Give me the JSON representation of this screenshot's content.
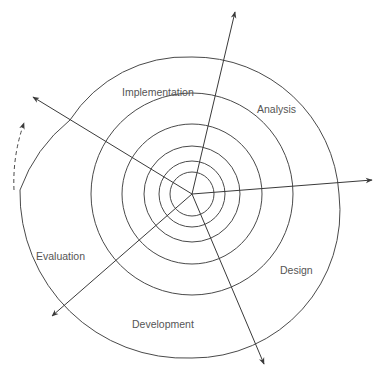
{
  "diagram": {
    "type": "spiral-model",
    "center": [
      192,
      194
    ],
    "stroke_color": "#4a4a4a",
    "label_color": "#555555",
    "phases": [
      {
        "label": "Implementation",
        "x": 122,
        "y": 86
      },
      {
        "label": "Analysis",
        "x": 257,
        "y": 103
      },
      {
        "label": "Design",
        "x": 280,
        "y": 264
      },
      {
        "label": "Development",
        "x": 132,
        "y": 318
      },
      {
        "label": "Evaluation",
        "x": 36,
        "y": 250
      }
    ],
    "rings_radii": [
      24,
      33,
      48,
      69,
      100,
      146
    ],
    "axes": [
      {
        "name": "axis-up",
        "to": [
          235,
          12
        ]
      },
      {
        "name": "axis-right",
        "to": [
          372,
          180
        ]
      },
      {
        "name": "axis-down-right",
        "to": [
          264,
          364
        ]
      },
      {
        "name": "axis-down-left",
        "to": [
          52,
          316
        ]
      },
      {
        "name": "axis-up-left",
        "to": [
          33,
          97
        ]
      }
    ],
    "continuation_arrow": "dashed"
  }
}
